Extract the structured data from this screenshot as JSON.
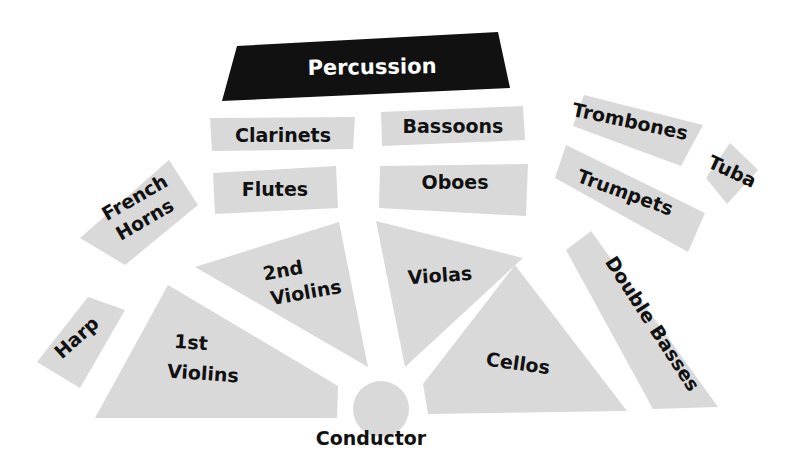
{
  "diagram": {
    "colors": {
      "section_fill": "#d9d9d9",
      "percussion_fill": "#111111",
      "label_text": "#111111",
      "percussion_text": "#ffffff",
      "background": "#ffffff"
    },
    "sections": {
      "percussion": "Percussion",
      "clarinets": "Clarinets",
      "bassoons": "Bassoons",
      "trombones": "Trombones",
      "tuba": "Tuba",
      "french_horns_line1": "French",
      "french_horns_line2": "Horns",
      "flutes": "Flutes",
      "oboes": "Oboes",
      "trumpets": "Trumpets",
      "harp": "Harp",
      "second_violins_line1": "2nd",
      "second_violins_line2": "Violins",
      "violas": "Violas",
      "double_basses": "Double Basses",
      "first_violins_line1": "1st",
      "first_violins_line2": "Violins",
      "cellos": "Cellos",
      "conductor": "Conductor"
    }
  }
}
